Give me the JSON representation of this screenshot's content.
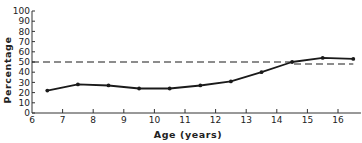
{
  "chart_data": {
    "type": "line",
    "title": "",
    "xlabel": "Age (years)",
    "ylabel": "Percentage",
    "xlim": [
      6,
      16.6
    ],
    "ylim": [
      0,
      100
    ],
    "x_ticks": [
      "6",
      "7",
      "8",
      "9",
      "10",
      "11",
      "12",
      "13",
      "14",
      "15",
      "16"
    ],
    "y_ticks": [
      "0",
      "10",
      "20",
      "30",
      "40",
      "50",
      "60",
      "70",
      "80",
      "90",
      "100"
    ],
    "grid": false,
    "legend": null,
    "series": [
      {
        "name": "Observed percentage",
        "style": "solid-with-markers",
        "x": [
          6.5,
          7.5,
          8.5,
          9.5,
          10.5,
          11.5,
          12.5,
          13.5,
          14.5,
          15.5,
          16.5
        ],
        "values": [
          22,
          28,
          27,
          24,
          24,
          27,
          31,
          40,
          50,
          54,
          53
        ]
      },
      {
        "name": "Reference line",
        "style": "dashed",
        "x": [
          6,
          14.5,
          14.5,
          16.5
        ],
        "values": [
          50,
          50,
          48,
          48
        ]
      }
    ],
    "colors": {
      "line": "#1a1a1a",
      "axis": "#333333",
      "text": "#222222"
    }
  }
}
